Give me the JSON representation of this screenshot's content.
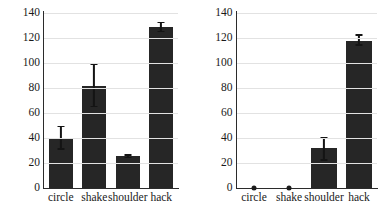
{
  "chart_data": [
    {
      "panel": "left",
      "type": "bar",
      "title": "",
      "xlabel": "",
      "ylabel": "",
      "ylim": [
        0,
        140
      ],
      "yticks": [
        0,
        20,
        40,
        60,
        80,
        100,
        120,
        140
      ],
      "grid": true,
      "legend": "none",
      "categories": [
        "circle",
        "shake",
        "shoulder",
        "hack"
      ],
      "values": [
        40,
        82,
        26,
        129
      ],
      "errors_low": [
        32,
        66,
        25,
        126
      ],
      "errors_high": [
        50,
        100,
        27,
        133
      ],
      "bar_color": "#262626"
    },
    {
      "panel": "right",
      "type": "bar",
      "title": "",
      "xlabel": "",
      "ylabel": "",
      "ylim": [
        0,
        140
      ],
      "yticks": [
        0,
        20,
        40,
        60,
        80,
        100,
        120,
        140
      ],
      "grid": true,
      "legend": "none",
      "categories": [
        "circle",
        "shake",
        "shoulder",
        "hack"
      ],
      "values": [
        0,
        0,
        32,
        118
      ],
      "errors_low": [
        0,
        0,
        23,
        115
      ],
      "errors_high": [
        0,
        0,
        41,
        123
      ],
      "bar_color": "#262626"
    }
  ]
}
